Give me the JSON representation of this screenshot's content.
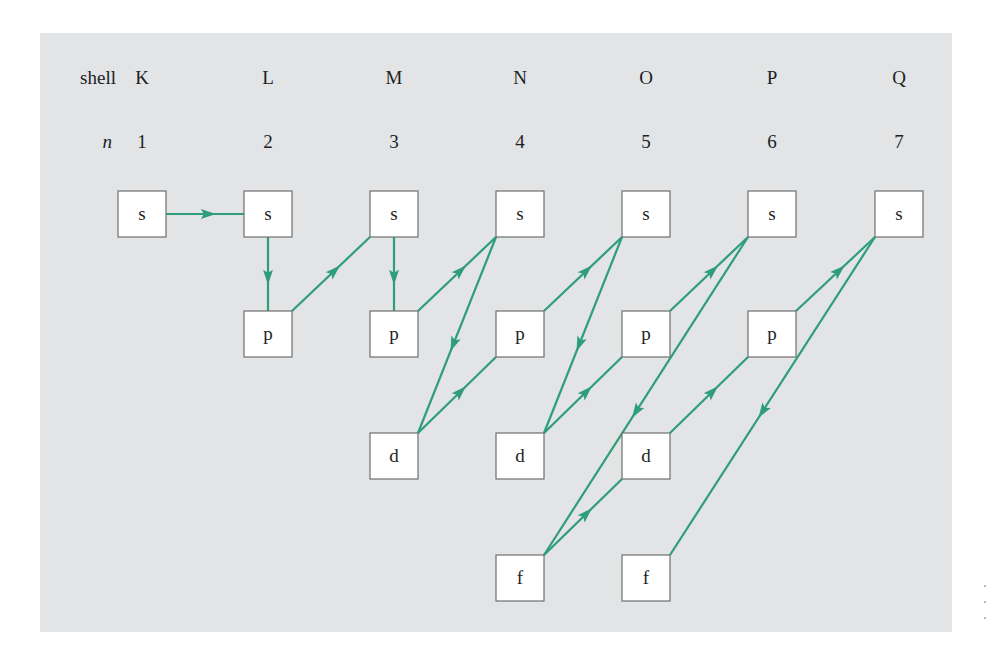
{
  "diagram": {
    "colors": {
      "panel_background": "#e2e4e6",
      "arrow": "#2e9e7a",
      "box_fill": "#ffffff",
      "box_stroke": "#6f6f6f",
      "text": "#1e1e1e"
    },
    "row_labels": {
      "shell_label": "shell",
      "n_label": "n"
    },
    "shells": [
      {
        "shell": "K",
        "n": "1",
        "x": 142
      },
      {
        "shell": "L",
        "n": "2",
        "x": 268
      },
      {
        "shell": "M",
        "n": "3",
        "x": 394
      },
      {
        "shell": "N",
        "n": "4",
        "x": 520
      },
      {
        "shell": "O",
        "n": "5",
        "x": 646
      },
      {
        "shell": "P",
        "n": "6",
        "x": 772
      },
      {
        "shell": "Q",
        "n": "7",
        "x": 899
      }
    ],
    "subshell_rows": [
      {
        "type": "s",
        "y": 191
      },
      {
        "type": "p",
        "y": 311
      },
      {
        "type": "d",
        "y": 433
      },
      {
        "type": "f",
        "y": 555
      }
    ],
    "box_size": {
      "width": 48,
      "height": 46
    },
    "nodes": [
      {
        "id": "1s",
        "col": 0,
        "row": 0,
        "label": "s"
      },
      {
        "id": "2s",
        "col": 1,
        "row": 0,
        "label": "s"
      },
      {
        "id": "2p",
        "col": 1,
        "row": 1,
        "label": "p"
      },
      {
        "id": "3s",
        "col": 2,
        "row": 0,
        "label": "s"
      },
      {
        "id": "3p",
        "col": 2,
        "row": 1,
        "label": "p"
      },
      {
        "id": "3d",
        "col": 2,
        "row": 2,
        "label": "d"
      },
      {
        "id": "4s",
        "col": 3,
        "row": 0,
        "label": "s"
      },
      {
        "id": "4p",
        "col": 3,
        "row": 1,
        "label": "p"
      },
      {
        "id": "4d",
        "col": 3,
        "row": 2,
        "label": "d"
      },
      {
        "id": "4f",
        "col": 3,
        "row": 3,
        "label": "f"
      },
      {
        "id": "5s",
        "col": 4,
        "row": 0,
        "label": "s"
      },
      {
        "id": "5p",
        "col": 4,
        "row": 1,
        "label": "p"
      },
      {
        "id": "5d",
        "col": 4,
        "row": 2,
        "label": "d"
      },
      {
        "id": "5f",
        "col": 4,
        "row": 3,
        "label": "f"
      },
      {
        "id": "6s",
        "col": 5,
        "row": 0,
        "label": "s"
      },
      {
        "id": "6p",
        "col": 5,
        "row": 1,
        "label": "p"
      },
      {
        "id": "7s",
        "col": 6,
        "row": 0,
        "label": "s"
      }
    ],
    "edges": [
      {
        "from": "1s",
        "to": "2s",
        "from_anchor": "right-mid",
        "to_anchor": "left-mid"
      },
      {
        "from": "2s",
        "to": "2p",
        "from_anchor": "bottom-mid",
        "to_anchor": "top-mid"
      },
      {
        "from": "2p",
        "to": "3s",
        "from_anchor": "top-right",
        "to_anchor": "bottom-left"
      },
      {
        "from": "3s",
        "to": "3p",
        "from_anchor": "bottom-mid",
        "to_anchor": "top-mid"
      },
      {
        "from": "3p",
        "to": "4s",
        "from_anchor": "top-right",
        "to_anchor": "bottom-left"
      },
      {
        "from": "4s",
        "to": "3d",
        "from_anchor": "bottom-left",
        "to_anchor": "top-right"
      },
      {
        "from": "3d",
        "to": "4p",
        "from_anchor": "top-right",
        "to_anchor": "bottom-left"
      },
      {
        "from": "4p",
        "to": "5s",
        "from_anchor": "top-right",
        "to_anchor": "bottom-left"
      },
      {
        "from": "5s",
        "to": "4d",
        "from_anchor": "bottom-left",
        "to_anchor": "top-right"
      },
      {
        "from": "4d",
        "to": "5p",
        "from_anchor": "top-right",
        "to_anchor": "bottom-left"
      },
      {
        "from": "5p",
        "to": "6s",
        "from_anchor": "top-right",
        "to_anchor": "bottom-left"
      },
      {
        "from": "6s",
        "to": "4f",
        "from_anchor": "bottom-left",
        "to_anchor": "top-right"
      },
      {
        "from": "4f",
        "to": "5d",
        "from_anchor": "top-right",
        "to_anchor": "bottom-left"
      },
      {
        "from": "5d",
        "to": "6p",
        "from_anchor": "top-right",
        "to_anchor": "bottom-left"
      },
      {
        "from": "6p",
        "to": "7s",
        "from_anchor": "top-right",
        "to_anchor": "bottom-left"
      },
      {
        "from": "7s",
        "to": "5f",
        "from_anchor": "bottom-left",
        "to_anchor": "top-right"
      }
    ]
  }
}
